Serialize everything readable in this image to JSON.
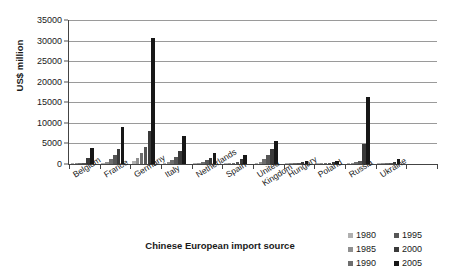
{
  "chart_data": {
    "type": "bar",
    "title": "",
    "xlabel": "Chinese European import source",
    "ylabel": "US$ million",
    "ylim": [
      0,
      35000
    ],
    "ytick_values": [
      0,
      5000,
      10000,
      15000,
      20000,
      25000,
      30000,
      35000
    ],
    "ytick_labels": [
      "0",
      "5000",
      "10000",
      "15000",
      "20000",
      "25000",
      "30000",
      "35000"
    ],
    "grid": true,
    "legend_position": "bottom-right",
    "categories": [
      "Belgium",
      "France",
      "Germany",
      "Italy",
      "Netherlands",
      "Spain",
      "United Kingdom",
      "Hungary",
      "Poland",
      "Russia",
      "Ukraine",
      ""
    ],
    "category_label_lines": [
      [
        "Belgium"
      ],
      [
        "France"
      ],
      [
        "Germany"
      ],
      [
        "Italy"
      ],
      [
        "Netherlands"
      ],
      [
        "Spain"
      ],
      [
        "United",
        "Kingdom"
      ],
      [
        "Hungary"
      ],
      [
        "Poland"
      ],
      [
        "Russia"
      ],
      [
        "Ukraine"
      ],
      [
        ""
      ]
    ],
    "series": [
      {
        "name": "1980",
        "color": "#b0b0b0",
        "values": [
          60,
          150,
          700,
          200,
          120,
          60,
          200,
          60,
          60,
          180,
          60,
          0
        ]
      },
      {
        "name": "1985",
        "color": "#8f8f8f",
        "values": [
          90,
          500,
          1500,
          400,
          250,
          120,
          600,
          120,
          100,
          250,
          100,
          0
        ]
      },
      {
        "name": "1990",
        "color": "#6e6e6e",
        "values": [
          150,
          1200,
          2700,
          900,
          500,
          300,
          1300,
          200,
          150,
          400,
          200,
          0
        ]
      },
      {
        "name": "1995",
        "color": "#565656",
        "values": [
          300,
          2300,
          4200,
          1600,
          900,
          600,
          2200,
          300,
          250,
          700,
          350,
          0
        ]
      },
      {
        "name": "2000",
        "color": "#3a3a3a",
        "values": [
          1400,
          3600,
          8000,
          3100,
          1500,
          1100,
          3600,
          450,
          400,
          4800,
          600,
          0
        ]
      },
      {
        "name": "2005",
        "color": "#171717",
        "values": [
          3900,
          8900,
          30600,
          6900,
          2600,
          2200,
          5500,
          800,
          700,
          16200,
          1200,
          0
        ]
      }
    ]
  },
  "legend": {
    "entries": [
      {
        "label": "1980",
        "color": "#b0b0b0"
      },
      {
        "label": "1995",
        "color": "#565656"
      },
      {
        "label": "1985",
        "color": "#8f8f8f"
      },
      {
        "label": "2000",
        "color": "#3a3a3a"
      },
      {
        "label": "1990",
        "color": "#6e6e6e"
      },
      {
        "label": "2005",
        "color": "#171717"
      }
    ]
  },
  "axes": {
    "y_title": "US$ million",
    "x_title": "Chinese European import source"
  }
}
